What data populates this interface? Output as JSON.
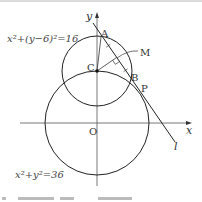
{
  "figure": {
    "small_circle_equation": "x²+(y−6)²=16",
    "big_circle_equation": "x²+y²=36",
    "axes": {
      "x_label": "x",
      "y_label": "y",
      "origin_label": "O"
    },
    "points": {
      "A": "A",
      "B": "B",
      "C": "C",
      "M": "M",
      "P": "P"
    },
    "line_label": "l",
    "colors": {
      "stroke": "#222222",
      "axis": "#555555",
      "border": "#cccccc"
    }
  }
}
